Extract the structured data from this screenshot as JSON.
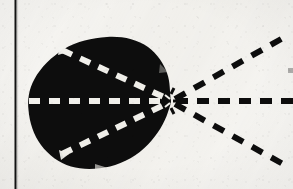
{
  "figure": {
    "kind": "scanned-diagram",
    "background_color": "#f6f5f2",
    "ink_color": "#0d0d0d",
    "dash_light_color": "#f4f3ef",
    "margin_rule": {
      "name": "left-margin-rule",
      "x": 15,
      "y_start": 0,
      "y_end": 189,
      "thickness": 2,
      "color": "#121212"
    },
    "lobe": {
      "name": "black-lobe",
      "fill": "#0d0d0d",
      "bounds": {
        "left": 28,
        "top": 37,
        "right": 172,
        "bottom": 169
      },
      "vertex": {
        "x": 171,
        "y": 101
      },
      "outline_path": "M 171 101 C 168 86 172 72 163 60 C 152 45 132 37 108 37 C 84 37 62 42 47 56 C 32 70 28 86 28 103 C 28 122 35 142 51 156 C 66 169 88 170 108 168 C 131 165 150 153 160 138 C 169 124 170 112 171 101 Z"
    },
    "convergence_point": {
      "name": "convergence-vertex",
      "x": 171,
      "y": 101
    },
    "rays": [
      {
        "name": "ray-axis-inner-white",
        "style": "dashed-light",
        "from": {
          "x": 29,
          "y": 101
        },
        "to": {
          "x": 168,
          "y": 101
        },
        "stroke": "#f4f3ef",
        "width": 6,
        "dash": "11 9"
      },
      {
        "name": "ray-upper-inner-white",
        "style": "dashed-light",
        "from": {
          "x": 62,
          "y": 50
        },
        "to": {
          "x": 168,
          "y": 99
        },
        "stroke": "#f4f3ef",
        "width": 6,
        "dash": "11 9"
      },
      {
        "name": "ray-lower-inner-white",
        "style": "dashed-light",
        "from": {
          "x": 62,
          "y": 154
        },
        "to": {
          "x": 168,
          "y": 103
        },
        "stroke": "#f4f3ef",
        "width": 6,
        "dash": "11 9"
      },
      {
        "name": "ray-axis-outer-black",
        "style": "dashed-dark",
        "from": {
          "x": 176,
          "y": 101
        },
        "to": {
          "x": 293,
          "y": 101
        },
        "stroke": "#0d0d0d",
        "width": 6,
        "dash": "12 9"
      },
      {
        "name": "ray-upper-outer-black",
        "style": "dashed-dark",
        "from": {
          "x": 175,
          "y": 99
        },
        "to": {
          "x": 283,
          "y": 38
        },
        "stroke": "#0d0d0d",
        "width": 6,
        "dash": "12 10"
      },
      {
        "name": "ray-lower-outer-black",
        "style": "dashed-dark",
        "from": {
          "x": 175,
          "y": 104
        },
        "to": {
          "x": 283,
          "y": 164
        },
        "stroke": "#0d0d0d",
        "width": 6,
        "dash": "12 10"
      }
    ],
    "edge_fragment": {
      "name": "clipped-dash-right-edge",
      "x": 288,
      "y": 68,
      "width": 5,
      "height": 5,
      "color": "#6a6a68"
    },
    "labels": []
  }
}
